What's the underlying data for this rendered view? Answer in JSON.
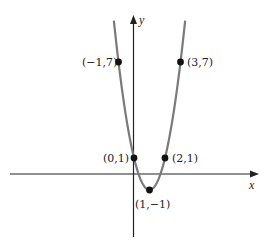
{
  "chart_data": {
    "type": "line",
    "title": "",
    "function": "y = 2(x-1)^2 - 1",
    "xlabel": "x",
    "ylabel": "y",
    "curve_color": "#7a7a7a",
    "axis_color": "#222222",
    "grid": false,
    "xlim": [
      -8,
      8
    ],
    "ylim": [
      -4,
      10
    ],
    "points": [
      {
        "x": -1,
        "y": 7,
        "label": "(−1,7)"
      },
      {
        "x": 3,
        "y": 7,
        "label": "(3,7)"
      },
      {
        "x": 0,
        "y": 1,
        "label": "(0,1)"
      },
      {
        "x": 2,
        "y": 1,
        "label": "(2,1)"
      },
      {
        "x": 1,
        "y": -1,
        "label": "(1,−1)"
      }
    ]
  },
  "labels": {
    "x_axis": "x",
    "y_axis": "y",
    "p1": "(−1,7)",
    "p2": "(3,7)",
    "p3": "(0,1)",
    "p4": "(2,1)",
    "p5": "(1,−1)"
  }
}
